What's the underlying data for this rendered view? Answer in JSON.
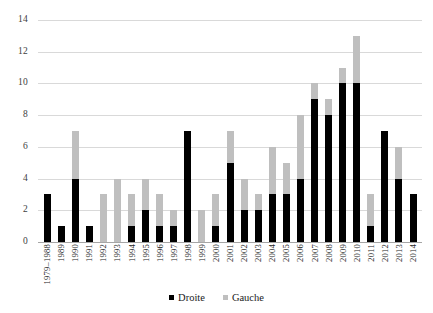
{
  "chart_data": {
    "type": "bar",
    "stacked": true,
    "title": "",
    "subtitle": "",
    "xlabel": "",
    "ylabel": "",
    "ylim": [
      0,
      14
    ],
    "yticks": [
      0,
      2,
      4,
      6,
      8,
      10,
      12,
      14
    ],
    "grid": true,
    "legend_position": "bottom",
    "categories": [
      "1979–1988",
      "1989",
      "1990",
      "1991",
      "1992",
      "1993",
      "1994",
      "1995",
      "1996",
      "1997",
      "1998",
      "1999",
      "2000",
      "2001",
      "2002",
      "2003",
      "2004",
      "2005",
      "2006",
      "2007",
      "2008",
      "2009",
      "2010",
      "2011",
      "2012",
      "2013",
      "2014"
    ],
    "series": [
      {
        "name": "Droite",
        "color": "#000000",
        "values": [
          3,
          1,
          4,
          1,
          0,
          0,
          1,
          2,
          1,
          1,
          7,
          0,
          1,
          5,
          2,
          2,
          3,
          3,
          4,
          9,
          8,
          10,
          10,
          1,
          7,
          4,
          3
        ]
      },
      {
        "name": "Gauche",
        "color": "#bfbfbf",
        "values": [
          0,
          0,
          3,
          0,
          3,
          4,
          2,
          2,
          2,
          1,
          0,
          2,
          2,
          2,
          2,
          1,
          3,
          2,
          4,
          1,
          1,
          1,
          3,
          2,
          0,
          2,
          0
        ]
      }
    ],
    "totals": [
      3,
      1,
      7,
      1,
      3,
      4,
      3,
      4,
      3,
      2,
      7,
      2,
      3,
      7,
      4,
      3,
      6,
      5,
      8,
      10,
      9,
      11,
      13,
      3,
      7,
      6,
      3
    ]
  },
  "legend": {
    "items": [
      {
        "label": "Droite",
        "color": "#000000"
      },
      {
        "label": "Gauche",
        "color": "#bfbfbf"
      }
    ]
  },
  "colors": {
    "droite": "#000000",
    "gauche": "#bfbfbf",
    "gridline": "#d9d9d9",
    "axis": "#a6a6a6",
    "background": "#ffffff"
  }
}
